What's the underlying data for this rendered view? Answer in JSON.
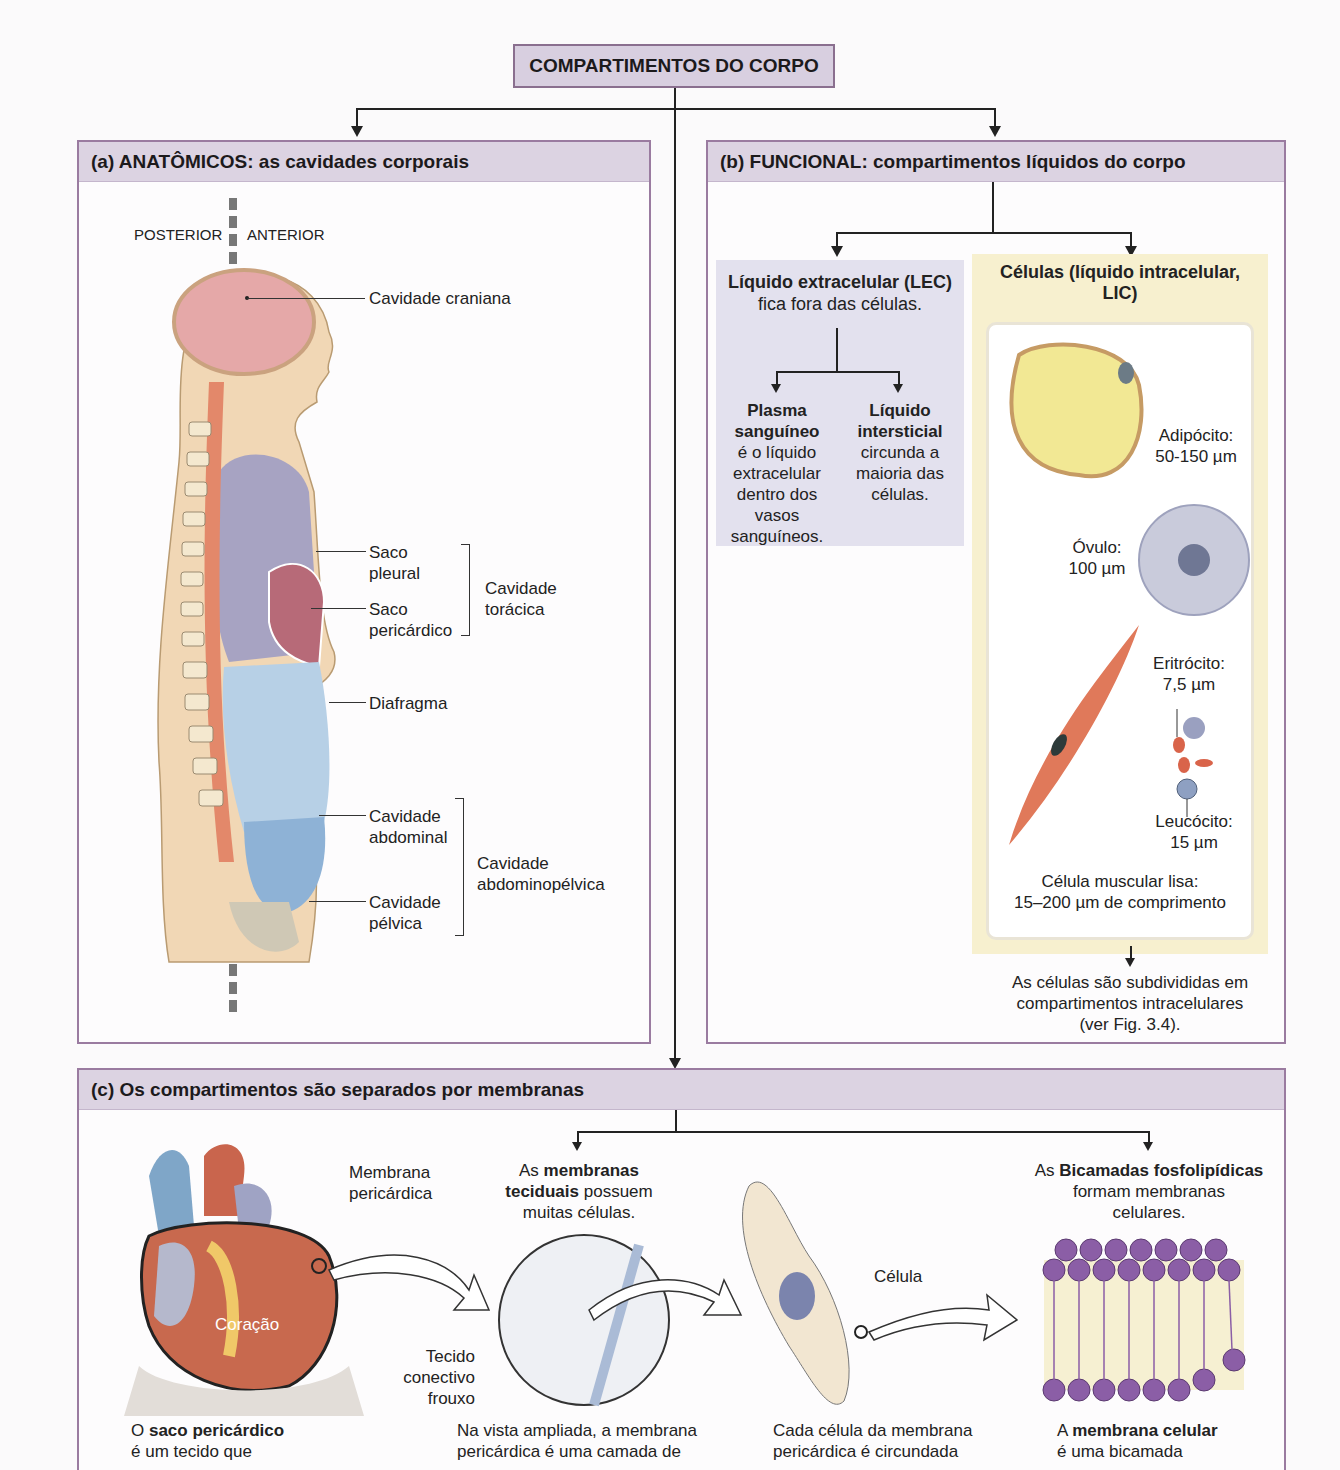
{
  "title": "COMPARTIMENTOS DO CORPO",
  "colors": {
    "panel_border": "#9a7ba0",
    "panel_header": "#dcd3e2",
    "title_box": "#d8cfe0",
    "lec_box": "#e3e1ee",
    "lic_box": "#f7f0cf",
    "cranial": "#e5a8a8",
    "pleural": "#a7a3c2",
    "pericardial": "#b76a78",
    "abdominal": "#b7d0e6",
    "pelvic": "#8eb2d6",
    "skin": "#f1d7b5",
    "spine": "#e3886a"
  },
  "panel_a": {
    "heading": "(a) ANATÔMICOS: as cavidades corporais",
    "posterior": "POSTERIOR",
    "anterior": "ANTERIOR",
    "labels": {
      "cranial": "Cavidade craniana",
      "pleural": [
        "Saco",
        "pleural"
      ],
      "pericardial": [
        "Saco",
        "pericárdico"
      ],
      "thoracic": [
        "Cavidade",
        "torácica"
      ],
      "diaphragm": "Diafragma",
      "abdominal": [
        "Cavidade",
        "abdominal"
      ],
      "pelvic": [
        "Cavidade",
        "pélvica"
      ],
      "abdominopelvic": [
        "Cavidade",
        "abdominopélvica"
      ]
    }
  },
  "panel_b": {
    "heading": "(b) FUNCIONAL: compartimentos líquidos do corpo",
    "lec": {
      "title": "Líquido extracelular (LEC)",
      "subtitle": "fica fora das células.",
      "plasma_title": [
        "Plasma",
        "sanguíneo"
      ],
      "plasma_text": [
        "é o líquido",
        "extracelular",
        "dentro dos",
        "vasos",
        "sanguíneos."
      ],
      "interstitial_title": [
        "Líquido",
        "intersticial"
      ],
      "interstitial_text": [
        "circunda a",
        "maioria das",
        "células."
      ]
    },
    "lic": {
      "title": [
        "Células (líquido intracelular,",
        "LIC)"
      ],
      "adipocyte": [
        "Adipócito:",
        "50-150 µm"
      ],
      "ovum": [
        "Óvulo:",
        "100 µm"
      ],
      "erythrocyte": [
        "Eritrócito:",
        "7,5 µm"
      ],
      "leukocyte": [
        "Leucócito:",
        "15 µm"
      ],
      "smooth_muscle": [
        "Célula muscular lisa:",
        "15–200 µm de comprimento"
      ]
    },
    "footer": [
      "As células são subdivididas em",
      "compartimentos intracelulares",
      "(ver Fig. 3.4)."
    ]
  },
  "panel_c": {
    "heading": "(c) Os compartimentos são separados por membranas",
    "heart": {
      "label_membrane": [
        "Membrana",
        "pericárdica"
      ],
      "label_heart": "Coração",
      "caption_pre": "O ",
      "caption_bold": "saco pericárdico",
      "caption_line2": "é um tecido que"
    },
    "tissue": {
      "top_pre": "As ",
      "top_bold1": "membranas",
      "top_bold2": "teciduais",
      "top_post": " possuem",
      "top_line3": "muitas células.",
      "label": [
        "Tecido",
        "conectivo",
        "frouxo"
      ],
      "caption": [
        "Na vista ampliada, a membrana",
        "pericárdica é uma camada de"
      ]
    },
    "cell": {
      "label": "Célula",
      "caption": [
        "Cada célula da membrana",
        "pericárdica é circundada"
      ]
    },
    "bilayer": {
      "top_pre": "As ",
      "top_bold": "Bicamadas fosfolipídicas",
      "top_line2": "formam membranas",
      "top_line3": "celulares.",
      "caption_pre": "A ",
      "caption_bold": "membrana celular",
      "caption_line2": "é uma bicamada"
    }
  }
}
